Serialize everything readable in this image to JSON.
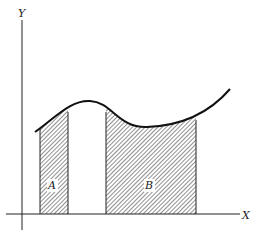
{
  "diagram": {
    "type": "area-under-curve",
    "axes": {
      "x_label": "X",
      "y_label": "Y"
    },
    "regions": [
      {
        "label": "A",
        "x_start": 40,
        "x_end": 68
      },
      {
        "label": "B",
        "x_start": 106,
        "x_end": 196
      }
    ],
    "colors": {
      "stroke": "#1a1a1a",
      "hatch": "#333333",
      "background": "#ffffff"
    }
  }
}
